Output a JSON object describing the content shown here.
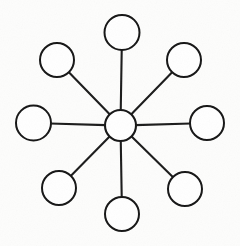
{
  "document": {
    "title": "Star Network Diagram",
    "description": "Hand-drawn hub-and-spoke (star) network diagram",
    "background_color": "#fdfdfc",
    "ink_color": "#141414",
    "width": 240,
    "height": 246
  },
  "chart_data": {
    "type": "diagram",
    "subtype": "node-link-star",
    "title": "",
    "xlabel": "",
    "ylabel": "",
    "legend": [],
    "annotations": [],
    "grid": false,
    "stroke_color": "#141414",
    "fill_color": "#ffffff",
    "stroke_width": 2,
    "hub": {
      "id": "hub",
      "label": "",
      "cx": 120.5,
      "cy": 125.5,
      "r": 15.5
    },
    "nodes": [
      {
        "id": "node-n",
        "label": "",
        "position": "top",
        "cx": 122,
        "cy": 32.5,
        "r": 17.5,
        "angle_deg": 90
      },
      {
        "id": "node-nw",
        "label": "",
        "position": "top-left",
        "cx": 57,
        "cy": 60,
        "r": 17.0,
        "angle_deg": 135
      },
      {
        "id": "node-ne",
        "label": "",
        "position": "top-right",
        "cx": 184,
        "cy": 60,
        "r": 17.0,
        "angle_deg": 45
      },
      {
        "id": "node-w",
        "label": "",
        "position": "left",
        "cx": 33.5,
        "cy": 123,
        "r": 17.5,
        "angle_deg": 180
      },
      {
        "id": "node-e",
        "label": "",
        "position": "right",
        "cx": 207,
        "cy": 123,
        "r": 17.0,
        "angle_deg": 0
      },
      {
        "id": "node-sw",
        "label": "",
        "position": "bottom-left",
        "cx": 59,
        "cy": 188,
        "r": 17.0,
        "angle_deg": 225
      },
      {
        "id": "node-se",
        "label": "",
        "position": "bottom-right",
        "cx": 185,
        "cy": 189,
        "r": 17.0,
        "angle_deg": 315
      },
      {
        "id": "node-s",
        "label": "",
        "position": "bottom",
        "cx": 122,
        "cy": 214,
        "r": 17.0,
        "angle_deg": 270
      }
    ],
    "edges": [
      {
        "id": "edge-hub-n",
        "from": "hub",
        "to": "node-n",
        "label": ""
      },
      {
        "id": "edge-hub-nw",
        "from": "hub",
        "to": "node-nw",
        "label": ""
      },
      {
        "id": "edge-hub-ne",
        "from": "hub",
        "to": "node-ne",
        "label": ""
      },
      {
        "id": "edge-hub-w",
        "from": "hub",
        "to": "node-w",
        "label": ""
      },
      {
        "id": "edge-hub-e",
        "from": "hub",
        "to": "node-e",
        "label": ""
      },
      {
        "id": "edge-hub-sw",
        "from": "hub",
        "to": "node-sw",
        "label": ""
      },
      {
        "id": "edge-hub-se",
        "from": "hub",
        "to": "node-se",
        "label": ""
      },
      {
        "id": "edge-hub-s",
        "from": "hub",
        "to": "node-s",
        "label": ""
      }
    ],
    "node_count": 8,
    "edge_count": 8
  }
}
